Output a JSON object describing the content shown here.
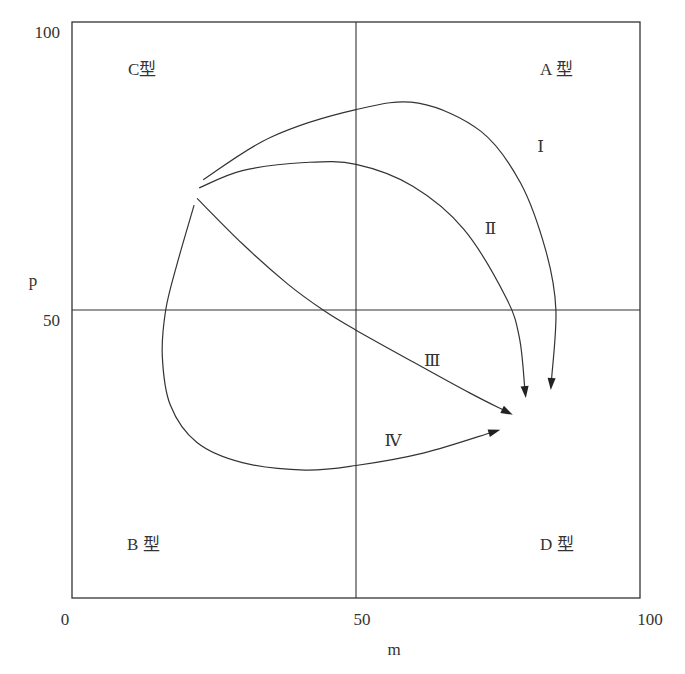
{
  "chart_data": {
    "type": "line",
    "title": "",
    "xlabel": "m",
    "ylabel": "p",
    "xlim": [
      0,
      100
    ],
    "ylim": [
      0,
      100
    ],
    "grid": false,
    "x_ticks": [
      "0",
      "50",
      "100"
    ],
    "y_ticks": [
      "50",
      "100"
    ],
    "dividers": {
      "x": 50,
      "y": 50
    },
    "quadrants": [
      {
        "id": "C",
        "label": "C型",
        "position": "top-left"
      },
      {
        "id": "A",
        "label": "A 型",
        "position": "top-right"
      },
      {
        "id": "B",
        "label": "B 型",
        "position": "bottom-left"
      },
      {
        "id": "D",
        "label": "D 型",
        "position": "bottom-right"
      }
    ],
    "series": [
      {
        "name": "I",
        "label": "Ⅰ",
        "arrow_end": true,
        "points": [
          [
            23.1,
            72.6
          ],
          [
            35,
            80
          ],
          [
            50,
            84.8
          ],
          [
            61,
            85.9
          ],
          [
            72,
            81
          ],
          [
            79,
            72
          ],
          [
            83.5,
            60
          ],
          [
            85.2,
            50
          ],
          [
            84.3,
            36.1
          ]
        ],
        "label_at": [
          82.5,
          78.5
        ]
      },
      {
        "name": "II",
        "label": "Ⅱ",
        "arrow_end": true,
        "points": [
          [
            22.4,
            71.2
          ],
          [
            30,
            74.2
          ],
          [
            41,
            75.6
          ],
          [
            50,
            75.3
          ],
          [
            60,
            71.5
          ],
          [
            69,
            64
          ],
          [
            76.5,
            52
          ],
          [
            78.8,
            45
          ],
          [
            79.9,
            34.7
          ]
        ],
        "label_at": [
          73.7,
          64.3
        ]
      },
      {
        "name": "III",
        "label": "Ⅲ",
        "arrow_end": true,
        "points": [
          [
            22.0,
            69.4
          ],
          [
            30,
            61.5
          ],
          [
            38,
            54.5
          ],
          [
            44.2,
            50
          ],
          [
            50,
            46.5
          ],
          [
            60,
            41
          ],
          [
            70,
            35.6
          ],
          [
            77.6,
            31.8
          ]
        ],
        "label_at": [
          63.4,
          41.4
        ]
      },
      {
        "name": "IV",
        "label": "Ⅳ",
        "arrow_end": true,
        "points": [
          [
            21.5,
            68.2
          ],
          [
            18.5,
            58
          ],
          [
            16.5,
            50
          ],
          [
            15.9,
            42
          ],
          [
            17.3,
            33.5
          ],
          [
            22,
            27
          ],
          [
            30,
            23.5
          ],
          [
            41,
            22.2
          ],
          [
            50,
            23
          ],
          [
            62,
            25.2
          ],
          [
            75.4,
            29.2
          ]
        ],
        "label_at": [
          56.5,
          27.5
        ]
      }
    ]
  }
}
